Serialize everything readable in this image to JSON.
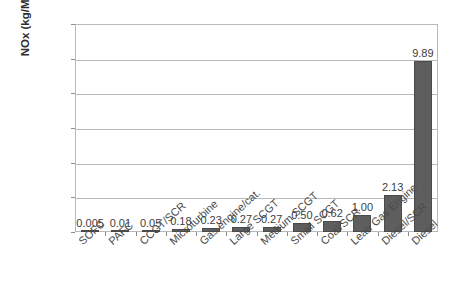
{
  "chart_data": {
    "type": "bar",
    "title": "",
    "xlabel": "",
    "ylabel": "NOx (kg/MWh)",
    "ylim": [
      0,
      12
    ],
    "ytick_labels": [
      "0.000",
      "2.000",
      "4.000",
      "6.000",
      "8.000",
      "10.000",
      "12.000"
    ],
    "ytick_values": [
      0,
      2,
      4,
      6,
      8,
      10,
      12
    ],
    "grid": true,
    "legend": "none",
    "categories": [
      "SOFC",
      "PAFC",
      "CCGT/SCR",
      "Microturbine",
      "Gas engine/cat.",
      "Large SCGT",
      "Medium SCGT",
      "Small SCGT",
      "Coal/SCR",
      "Lean Gas Engine",
      "Diesel/SCR",
      "Diesel"
    ],
    "values": [
      0.005,
      0.01,
      0.05,
      0.18,
      0.23,
      0.27,
      0.27,
      0.5,
      0.62,
      1.0,
      2.13,
      9.89
    ],
    "data_labels": [
      "0.005",
      "0.01",
      "0.05",
      "0.18",
      "0.23",
      "0.27",
      "0.27",
      "0.50",
      "0.62",
      "1.00",
      "2.13",
      "9.89"
    ],
    "bar_color": "#5e5e5e",
    "grid_color": "#b9b9b9",
    "background_color": "#ffffff"
  }
}
